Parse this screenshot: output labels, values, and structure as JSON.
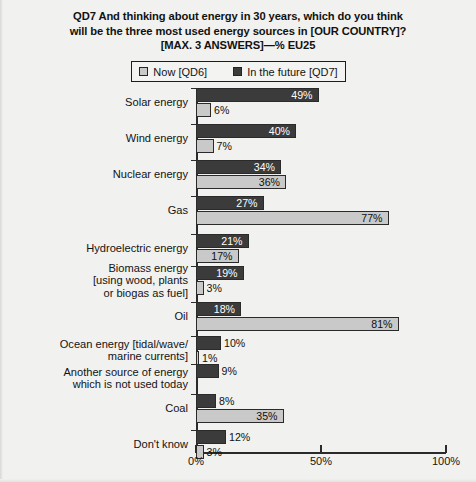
{
  "chart_data": {
    "type": "bar",
    "orientation": "horizontal",
    "grouped": true,
    "title": "QD7 And thinking about energy in 30 years, which do you think will be the three most used energy sources in [OUR COUNTRY]? [MAX. 3 ANSWERS]—% EU25",
    "title_lines": [
      "QD7 And thinking about energy in 30 years, which do you think",
      "will be the three most used energy sources in [OUR COUNTRY]?",
      "[MAX. 3 ANSWERS]—% EU25"
    ],
    "xlabel": "",
    "ylabel": "",
    "xlim": [
      0,
      100
    ],
    "xticks": [
      0,
      50,
      100
    ],
    "xtick_labels": [
      "0%",
      "50%",
      "100%"
    ],
    "grid": false,
    "legend_position": "top-center",
    "unit": "%",
    "categories": [
      "Solar energy",
      "Wind energy",
      "Nuclear energy",
      "Gas",
      "Hydroelectric energy",
      "Biomass energy [using wood, plants or biogas as fuel]",
      "Oil",
      "Ocean energy [tidal/wave/ marine currents]",
      "Another source of energy which is not used today",
      "Coal",
      "Don't know"
    ],
    "category_label_lines": [
      [
        "Solar energy"
      ],
      [
        "Wind energy"
      ],
      [
        "Nuclear energy"
      ],
      [
        "Gas"
      ],
      [
        "Hydroelectric energy"
      ],
      [
        "Biomass energy",
        "[using wood, plants",
        "or biogas as fuel]"
      ],
      [
        "Oil"
      ],
      [
        "Ocean energy [tidal/wave/",
        "marine currents]"
      ],
      [
        "Another source of energy",
        "which is not used today"
      ],
      [
        "Coal"
      ],
      [
        "Don't know"
      ]
    ],
    "series": [
      {
        "name": "In the future [QD7]",
        "key": "future",
        "color": "#3b3b3b",
        "label_color": "#ffffff",
        "values": [
          49,
          40,
          34,
          27,
          21,
          19,
          18,
          10,
          9,
          8,
          12
        ],
        "value_labels": [
          "49%",
          "40%",
          "34%",
          "27%",
          "21%",
          "19%",
          "18%",
          "10%",
          "9%",
          "8%",
          "12%"
        ]
      },
      {
        "name": "Now [QD6]",
        "key": "now",
        "color": "#c9c9c9",
        "label_color": "#101010",
        "values": [
          6,
          7,
          36,
          77,
          17,
          3,
          81,
          1,
          0,
          35,
          3
        ],
        "value_labels": [
          "6%",
          "7%",
          "36%",
          "77%",
          "17%",
          "3%",
          "81%",
          "1%",
          "",
          "35%",
          "3%"
        ]
      }
    ]
  },
  "legend": {
    "items": [
      {
        "label": "Now [QD6]",
        "swatch_color": "#c9c9c9"
      },
      {
        "label": "In the future [QD7]",
        "swatch_color": "#3b3b3b"
      }
    ]
  }
}
